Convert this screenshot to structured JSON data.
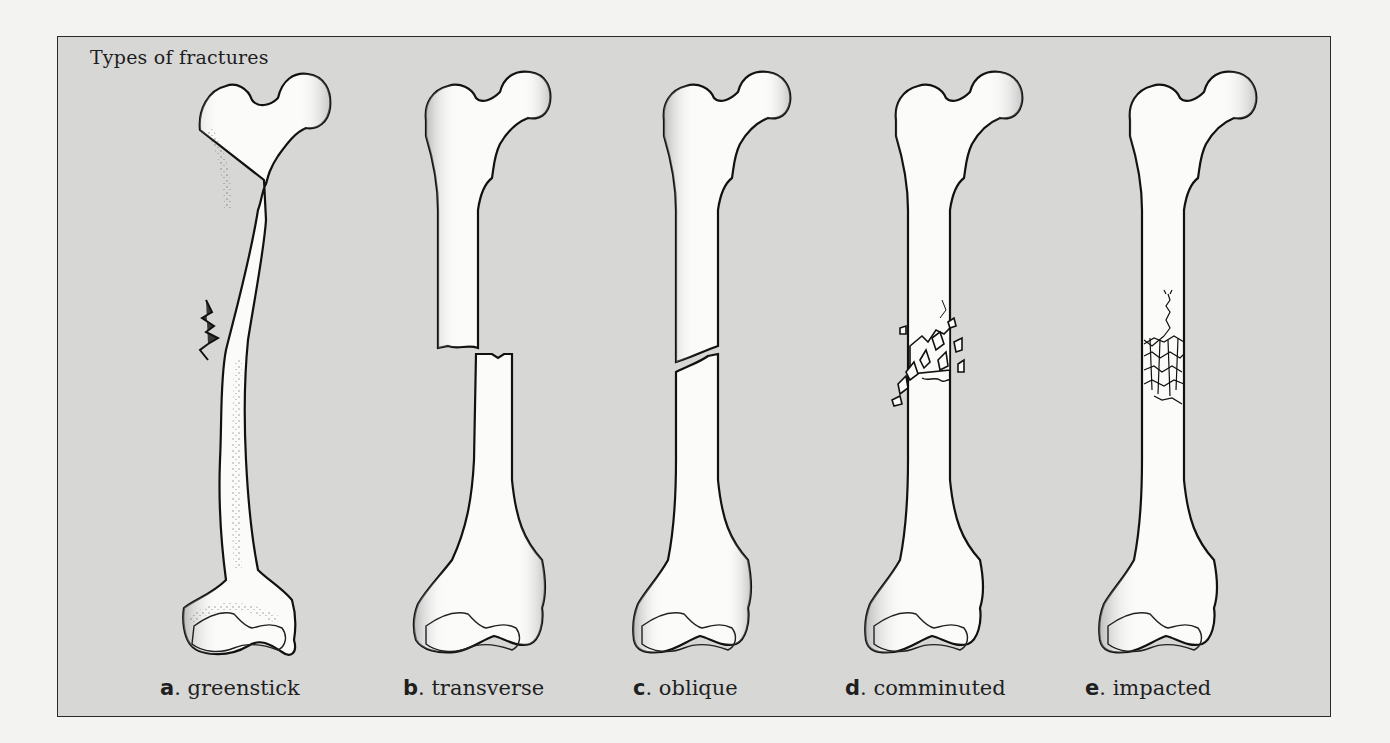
{
  "figure": {
    "title": "Types of fractures",
    "colors": {
      "page_background": "#f3f3f2",
      "panel_background": "#d7d7d6",
      "panel_border": "#2a2a2a",
      "bone_fill": "#fbfbfa",
      "ink": "#111111"
    },
    "panels": [
      {
        "letter": "a",
        "separator": ".",
        "label": "greenstick",
        "fracture": "greenstick"
      },
      {
        "letter": "b",
        "separator": ".",
        "label": "transverse",
        "fracture": "transverse"
      },
      {
        "letter": "c",
        "separator": ".",
        "label": "oblique",
        "fracture": "oblique"
      },
      {
        "letter": "d",
        "separator": ".",
        "label": "comminuted",
        "fracture": "comminuted"
      },
      {
        "letter": "e",
        "separator": ".",
        "label": "impacted",
        "fracture": "impacted"
      }
    ]
  }
}
